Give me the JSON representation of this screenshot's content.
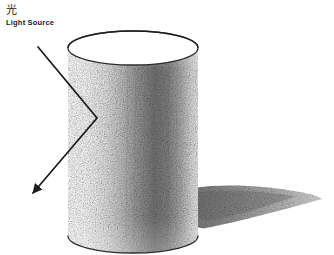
{
  "figure": {
    "medium": "pencil-sketch",
    "background_color": "#ffffff",
    "ink_color": "#1a1a1a",
    "width": 334,
    "height": 255
  },
  "annotations": {
    "light_source": {
      "kanji": "光",
      "english": "Light Source",
      "x": 6,
      "y": 5
    }
  },
  "light_ray": {
    "name": "incident-and-reflected-ray",
    "color": "#1a1a1a",
    "stroke_width": 1.6,
    "points": [
      {
        "x": 38,
        "y": 47
      },
      {
        "x": 97,
        "y": 118
      },
      {
        "x": 33,
        "y": 193
      }
    ],
    "arrowhead": {
      "x": 33,
      "y": 193,
      "angle_deg": 230
    }
  },
  "cylinder": {
    "name": "shaded-cylinder",
    "left": 68,
    "right": 198,
    "top_center_y": 48,
    "bottom_center_y": 236,
    "ellipse_ry": 17,
    "outline_color": "#2b2b2b",
    "top_face_fill": "#ffffff",
    "shading": {
      "highlight_color": "#ffffff",
      "midtone_color": "#b4b4b4",
      "core_shadow_color": "#5d5d5d",
      "rim_light_color": "#ededed",
      "gradient_stops": [
        {
          "offset": "0%",
          "color": "#ffffff"
        },
        {
          "offset": "18%",
          "color": "#fbfbfb"
        },
        {
          "offset": "34%",
          "color": "#d9d9d9"
        },
        {
          "offset": "52%",
          "color": "#8c8c8c"
        },
        {
          "offset": "66%",
          "color": "#6b6b6b"
        },
        {
          "offset": "80%",
          "color": "#8f8f8f"
        },
        {
          "offset": "91%",
          "color": "#d2d2d2"
        },
        {
          "offset": "100%",
          "color": "#efefef"
        }
      ]
    }
  },
  "cast_shadow": {
    "name": "cast-shadow",
    "color": "#8a8a8a",
    "start_x": 192,
    "tip_x": 322,
    "tip_y": 199,
    "top_y": 186,
    "bottom_y": 228
  }
}
